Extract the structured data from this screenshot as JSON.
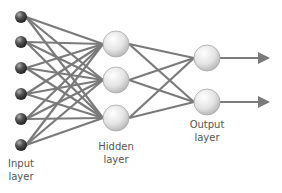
{
  "diagram": {
    "type": "neural-network",
    "layers": [
      {
        "name": "input",
        "label_line1": "Input",
        "label_line2": "layer",
        "node_count": 6
      },
      {
        "name": "hidden",
        "label_line1": "Hidden",
        "label_line2": "layer",
        "node_count": 3
      },
      {
        "name": "output",
        "label_line1": "Output",
        "label_line2": "layer",
        "node_count": 2
      }
    ],
    "connections": "fully-connected",
    "output_arrows": 2,
    "colors": {
      "edge": "#7a7a7a",
      "input_node": "#4a4a4a",
      "hidden_node": "#e6e6e6",
      "output_node": "#e6e6e6",
      "label": "#555555"
    }
  }
}
